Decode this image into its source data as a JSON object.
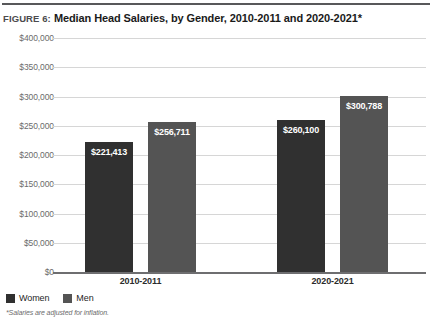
{
  "header": {
    "figure_number": "FIGURE 6:",
    "title": "Median Head Salaries, by Gender, 2010-2011 and 2020-2021*"
  },
  "footnote": "*Salaries are adjusted for inflation.",
  "colors": {
    "women": "#303030",
    "men": "#545454",
    "gridline": "#d6d6d6",
    "axis": "#6e6e70",
    "rule": "#58585a"
  },
  "chart_data": {
    "type": "bar",
    "title": "Median Head Salaries, by Gender, 2010-2011 and 2020-2021*",
    "xlabel": "",
    "ylabel": "",
    "categories": [
      "2010-2011",
      "2020-2021"
    ],
    "series": [
      {
        "name": "Women",
        "color": "#303030",
        "values": [
          221413,
          260100
        ],
        "labels": [
          "$221,413",
          "$260,100"
        ]
      },
      {
        "name": "Men",
        "color": "#545454",
        "values": [
          256711,
          300788
        ],
        "labels": [
          "$256,711",
          "$300,788"
        ]
      }
    ],
    "ylim": [
      0,
      400000
    ],
    "ytick_values": [
      0,
      50000,
      100000,
      150000,
      200000,
      250000,
      300000,
      350000,
      400000
    ],
    "ytick_labels": [
      "$0",
      "$50,000",
      "$100,000",
      "$150,000",
      "$200,000",
      "$250,000",
      "$300,000",
      "$350,000",
      "$400,000"
    ],
    "grid": true,
    "legend_position": "bottom-left",
    "legend": [
      "Women",
      "Men"
    ]
  }
}
